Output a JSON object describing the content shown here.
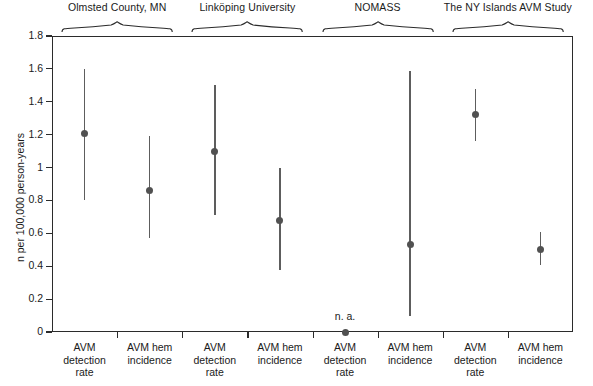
{
  "chart_data": {
    "type": "scatter",
    "title": "",
    "xlabel": "",
    "ylabel": "n per 100,000 person-years",
    "ylim": [
      0,
      1.8
    ],
    "ytick_labels": [
      "0",
      "0.2",
      "0.4",
      "0.6",
      "0.8",
      "1",
      "1.2",
      "1.4",
      "1.6",
      "1.8"
    ],
    "ytick_values": [
      0,
      0.2,
      0.4,
      0.6,
      0.8,
      1.0,
      1.2,
      1.4,
      1.6,
      1.8
    ],
    "grid": false,
    "legend": "none",
    "error_bars": "95% confidence interval",
    "groups": [
      {
        "label": "Olmsted County, MN"
      },
      {
        "label": "Linköping University"
      },
      {
        "label": "NOMASS"
      },
      {
        "label": "The NY Islands AVM Study"
      }
    ],
    "categories": [
      "AVM detection rate",
      "AVM hem incidence",
      "AVM detection rate",
      "AVM hem incidence",
      "AVM detection rate",
      "AVM hem incidence",
      "AVM detection rate",
      "AVM hem incidence"
    ],
    "category_lines": [
      [
        "AVM",
        "detection",
        "rate"
      ],
      [
        "AVM hem",
        "incidence"
      ],
      [
        "AVM",
        "detection",
        "rate"
      ],
      [
        "AVM hem",
        "incidence"
      ],
      [
        "AVM",
        "detection",
        "rate"
      ],
      [
        "AVM hem",
        "incidence"
      ],
      [
        "AVM",
        "detection",
        "rate"
      ],
      [
        "AVM hem",
        "incidence"
      ]
    ],
    "points": [
      {
        "group": "Olmsted County, MN",
        "category": "AVM detection rate",
        "value": 1.21,
        "low": 0.8,
        "high": 1.6,
        "annotation": ""
      },
      {
        "group": "Olmsted County, MN",
        "category": "AVM hem incidence",
        "value": 0.86,
        "low": 0.57,
        "high": 1.19,
        "annotation": ""
      },
      {
        "group": "Linköping University",
        "category": "AVM detection rate",
        "value": 1.1,
        "low": 0.71,
        "high": 1.5,
        "annotation": ""
      },
      {
        "group": "Linköping University",
        "category": "AVM hem incidence",
        "value": 0.68,
        "low": 0.38,
        "high": 1.0,
        "annotation": ""
      },
      {
        "group": "NOMASS",
        "category": "AVM detection rate",
        "value": 0.0,
        "low": null,
        "high": null,
        "annotation": "n. a."
      },
      {
        "group": "NOMASS",
        "category": "AVM hem incidence",
        "value": 0.53,
        "low": 0.1,
        "high": 1.59,
        "annotation": ""
      },
      {
        "group": "The NY Islands AVM Study",
        "category": "AVM detection rate",
        "value": 1.32,
        "low": 1.16,
        "high": 1.48,
        "annotation": ""
      },
      {
        "group": "The NY Islands AVM Study",
        "category": "AVM hem incidence",
        "value": 0.5,
        "low": 0.41,
        "high": 0.61,
        "annotation": ""
      }
    ],
    "colors": {
      "marker": "#515151",
      "errorbar": "#5d5d5d",
      "axis": "#2b2b2b",
      "text": "#1a1a1a",
      "background": "#ffffff"
    }
  }
}
